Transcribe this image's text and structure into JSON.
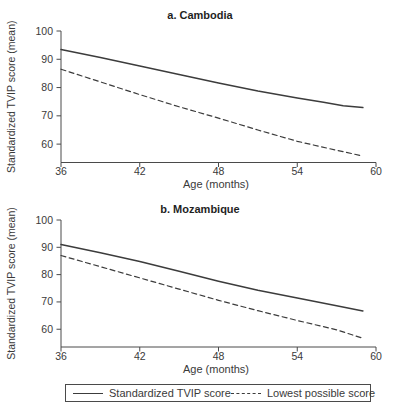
{
  "colors": {
    "line": "#3c3c3c",
    "axis": "#4a4a4a",
    "text": "#3a3a3a",
    "title": "#1f1f1f",
    "background": "#ffffff"
  },
  "legend": {
    "items": [
      {
        "label": "Standardized TVIP score",
        "style": "solid"
      },
      {
        "label": "Lowest possible score",
        "style": "dashed"
      }
    ]
  },
  "chart_data": [
    {
      "type": "line",
      "title": "a. Cambodia",
      "xlabel": "Age (months)",
      "ylabel": "Standardized TVIP score (mean)",
      "xlim": [
        36,
        60
      ],
      "ylim": [
        53.5,
        100
      ],
      "xticks": [
        36,
        42,
        48,
        54,
        60
      ],
      "yticks": [
        100,
        90,
        80,
        70,
        60
      ],
      "grid": false,
      "series": [
        {
          "name": "Standardized TVIP score",
          "style": "solid",
          "x": [
            36,
            39,
            42,
            45,
            48,
            51,
            54,
            56,
            57.5,
            59
          ],
          "y": [
            93.5,
            90.6,
            87.6,
            84.6,
            81.6,
            78.8,
            76.3,
            74.8,
            73.6,
            72.9
          ]
        },
        {
          "name": "Lowest possible score",
          "style": "dashed",
          "x": [
            36,
            39,
            42,
            45,
            48,
            51,
            54,
            57,
            59
          ],
          "y": [
            86.5,
            82.0,
            77.5,
            73.2,
            69.2,
            65.0,
            61.0,
            57.8,
            55.8
          ]
        }
      ]
    },
    {
      "type": "line",
      "title": "b. Mozambique",
      "xlabel": "Age (months)",
      "ylabel": "Standardized TVIP score (mean)",
      "xlim": [
        36,
        60
      ],
      "ylim": [
        53.5,
        100
      ],
      "xticks": [
        36,
        42,
        48,
        54,
        60
      ],
      "yticks": [
        100,
        90,
        80,
        70,
        60
      ],
      "grid": false,
      "series": [
        {
          "name": "Standardized TVIP score",
          "style": "solid",
          "x": [
            36,
            39,
            42,
            45,
            48,
            51,
            54,
            57,
            59
          ],
          "y": [
            91.0,
            88.0,
            84.8,
            81.2,
            77.6,
            74.3,
            71.4,
            68.6,
            66.7
          ]
        },
        {
          "name": "Lowest possible score",
          "style": "dashed",
          "x": [
            36,
            39,
            42,
            45,
            48,
            51,
            54,
            57,
            59
          ],
          "y": [
            87.0,
            82.9,
            78.8,
            74.7,
            70.6,
            66.8,
            63.2,
            59.8,
            56.7
          ]
        }
      ]
    }
  ]
}
